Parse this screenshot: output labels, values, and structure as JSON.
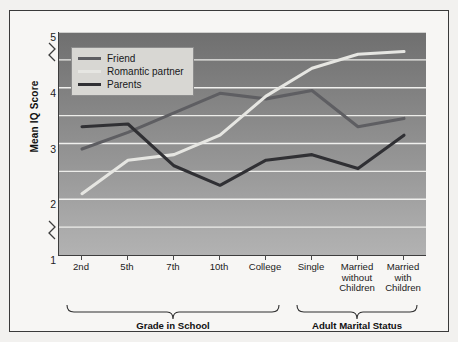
{
  "chart_data": {
    "type": "line",
    "title": "",
    "xlabel": "",
    "ylabel": "Mean IQ Score",
    "ylim": [
      1,
      5
    ],
    "yticks": [
      1,
      2,
      3,
      4,
      5
    ],
    "grid": true,
    "grid_axis": "y",
    "legend_position": "top-left",
    "axis_breaks": [
      1.5,
      4.5
    ],
    "categories": [
      "2nd",
      "5th",
      "7th",
      "10th",
      "College",
      "Single",
      "Married\nwithout\nChildren",
      "Married\nwith\nChildren"
    ],
    "series": [
      {
        "name": "Friend",
        "color": "#5e5e62",
        "values": [
          2.9,
          3.2,
          3.55,
          3.9,
          3.8,
          3.95,
          3.3,
          3.45
        ]
      },
      {
        "name": "Romantic partner",
        "color": "#e6e6e2",
        "values": [
          2.1,
          2.7,
          2.8,
          3.15,
          3.85,
          4.35,
          4.6,
          4.65
        ]
      },
      {
        "name": "Parents",
        "color": "#303034",
        "values": [
          3.3,
          3.35,
          2.6,
          2.25,
          2.7,
          2.8,
          2.55,
          3.15
        ]
      }
    ],
    "group_brackets": [
      {
        "label": "Grade in School",
        "from_index": 0,
        "to_index": 4
      },
      {
        "label": "Adult Marital Status",
        "from_index": 5,
        "to_index": 7
      }
    ]
  },
  "legend": {
    "items": [
      {
        "label": "Friend"
      },
      {
        "label": "Romantic partner"
      },
      {
        "label": "Parents"
      }
    ]
  },
  "axis": {
    "y_title": "Mean IQ Score",
    "y_tick_labels": [
      "5",
      "4",
      "3",
      "2",
      "1"
    ]
  }
}
